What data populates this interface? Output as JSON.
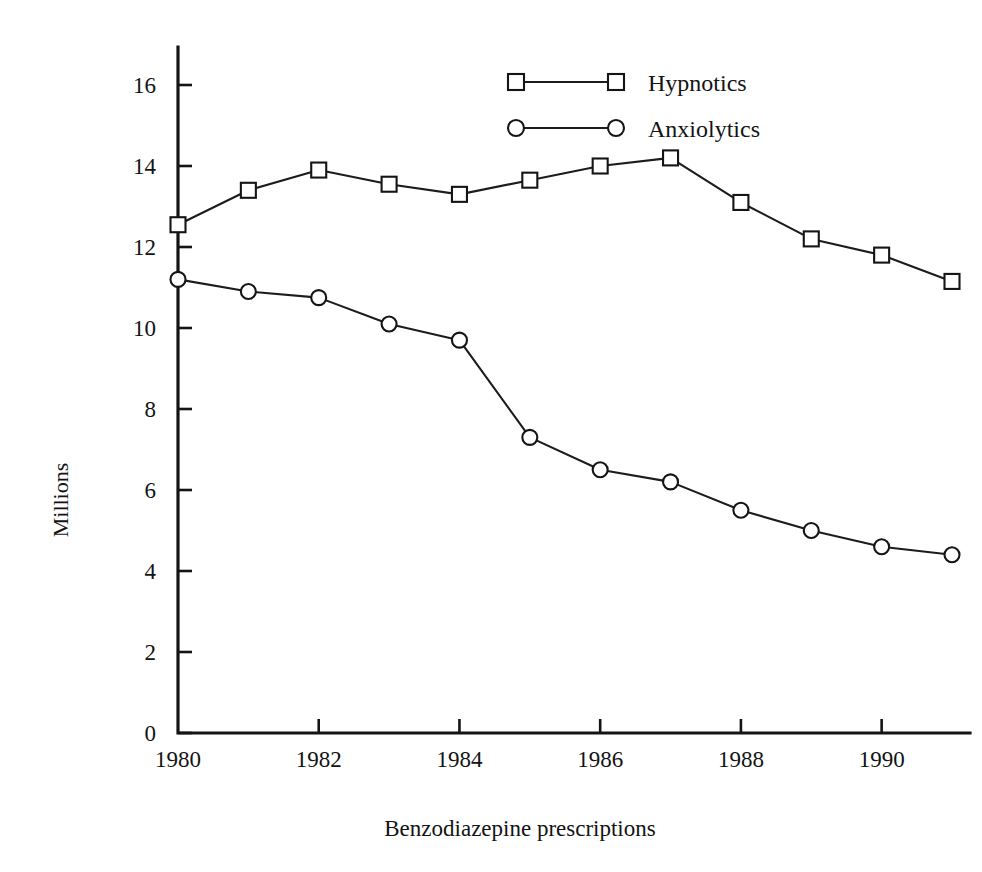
{
  "chart_data": {
    "type": "line",
    "title": "",
    "caption": "Benzodiazepine prescriptions",
    "xlabel": "",
    "ylabel": "Millions",
    "x": [
      1980,
      1981,
      1982,
      1983,
      1984,
      1985,
      1986,
      1987,
      1988,
      1989,
      1990,
      1991
    ],
    "xlim": [
      1980,
      1991
    ],
    "ylim": [
      0,
      16
    ],
    "xticks": [
      1980,
      1982,
      1984,
      1986,
      1988,
      1990
    ],
    "xticklabels": [
      "1980",
      "1982",
      "1984",
      "1986",
      "1988",
      "1990"
    ],
    "yticks": [
      0,
      2,
      4,
      6,
      8,
      10,
      12,
      14,
      16
    ],
    "yticklabels": [
      "0",
      "2",
      "4",
      "6",
      "8",
      "10",
      "12",
      "14",
      "16"
    ],
    "grid": false,
    "legend_position": "top-center",
    "series": [
      {
        "name": "Hypnotics",
        "marker": "square",
        "values": [
          12.55,
          13.4,
          13.9,
          13.55,
          13.3,
          13.65,
          14.0,
          14.2,
          13.1,
          12.2,
          11.8,
          11.15
        ]
      },
      {
        "name": "Anxiolytics",
        "marker": "circle",
        "values": [
          11.2,
          10.9,
          10.75,
          10.1,
          9.7,
          7.3,
          6.5,
          6.2,
          5.5,
          5.0,
          4.6,
          4.4
        ]
      }
    ]
  },
  "legend": {
    "entries": [
      {
        "label": "Hypnotics",
        "marker": "square"
      },
      {
        "label": "Anxiolytics",
        "marker": "circle"
      }
    ]
  },
  "axes": {
    "y_title": "Millions"
  },
  "caption": {
    "text": "Benzodiazepine prescriptions"
  }
}
